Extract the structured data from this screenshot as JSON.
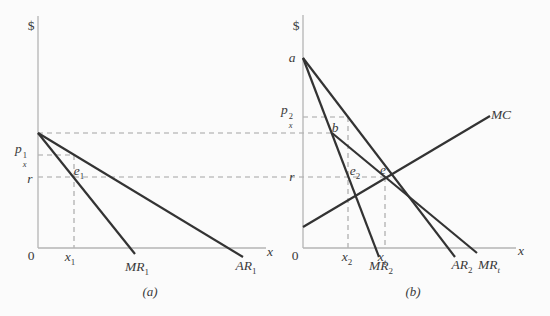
{
  "figure": {
    "colors": {
      "background": "#fbfbfb",
      "ink": "#333333",
      "axis": "#b4b4b4",
      "dash": "#a3a3a3",
      "text": "#3a3a3a"
    },
    "panel_a": {
      "caption": "(a)",
      "dollar": "$",
      "origin": "0",
      "x_axis": "x",
      "price": {
        "base": "p",
        "sup": "1",
        "sub": "x"
      },
      "rent": "r",
      "eq1": {
        "base": "e",
        "sub": "1"
      },
      "qty1": {
        "base": "x",
        "sub": "1"
      },
      "mr1": {
        "base": "MR",
        "sub": "1"
      },
      "ar1": {
        "base": "AR",
        "sub": "1"
      }
    },
    "panel_b": {
      "caption": "(b)",
      "dollar": "$",
      "origin": "0",
      "x_axis": "x",
      "intercept": "a",
      "kink": "b",
      "price": {
        "base": "p",
        "sup": "2",
        "sub": "x"
      },
      "rent": "r",
      "eq2": {
        "base": "e",
        "sub": "2"
      },
      "eq_total": "e",
      "qty2": {
        "base": "x",
        "sub": "2"
      },
      "qty_total": {
        "base": "x",
        "sub": "t"
      },
      "mr2": {
        "base": "MR",
        "sub": "2"
      },
      "ar2": {
        "base": "AR",
        "sub": "2"
      },
      "mr_total": {
        "base": "MR",
        "sub": "t"
      },
      "mc": "MC"
    }
  }
}
